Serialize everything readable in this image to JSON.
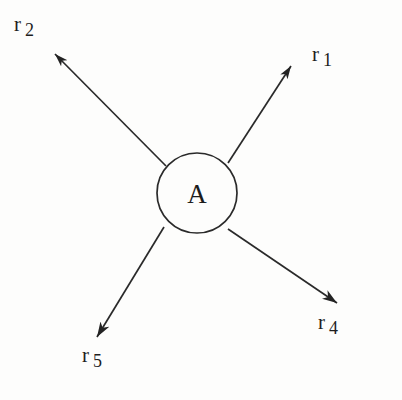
{
  "figure": {
    "type": "vector-diagram",
    "background_color": "#fdfdfc",
    "stroke_color": "#2a2a2a",
    "node": {
      "label": "A",
      "shape": "circle",
      "cx": 197,
      "cy": 193,
      "r": 40
    },
    "vectors": [
      {
        "id": "r1",
        "base": "r",
        "subscript": "1",
        "label": "r 1",
        "direction": "upper-right",
        "tail_x": 228,
        "tail_y": 163,
        "tip_x": 291,
        "tip_y": 66
      },
      {
        "id": "r2",
        "base": "r",
        "subscript": "2",
        "label": "r 2",
        "direction": "upper-left",
        "tail_x": 166,
        "tail_y": 166,
        "tip_x": 55,
        "tip_y": 54
      },
      {
        "id": "r4",
        "base": "r",
        "subscript": "4",
        "label": "r 4",
        "direction": "lower-right",
        "tail_x": 228,
        "tail_y": 229,
        "tip_x": 337,
        "tip_y": 303
      },
      {
        "id": "r5",
        "base": "r",
        "subscript": "5",
        "label": "r 5",
        "direction": "lower-left",
        "tail_x": 164,
        "tail_y": 227,
        "tip_x": 97,
        "tip_y": 337
      }
    ]
  }
}
